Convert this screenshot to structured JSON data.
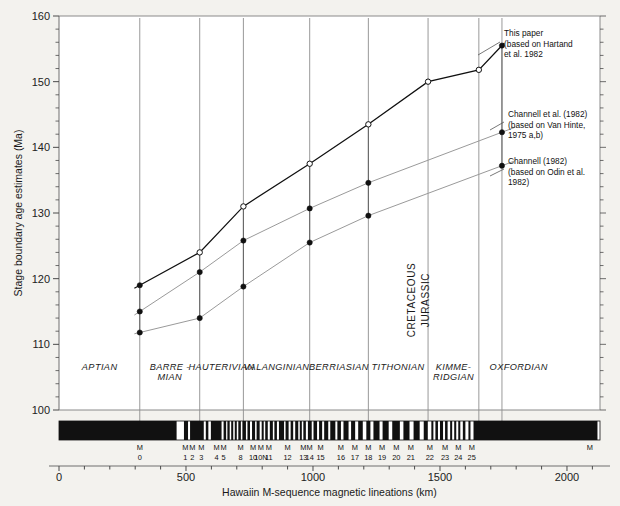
{
  "figure": {
    "background": "#f3f2ee",
    "plot_background": "#ffffff"
  },
  "chart_data": {
    "type": "line",
    "title": "",
    "xlabel": "Hawaiin M-sequence magnetic lineations (km)",
    "ylabel": "Stage boundary age estimates (Ma)",
    "xlim": [
      0,
      2130
    ],
    "ylim": [
      100,
      160
    ],
    "x_ticks": [
      0,
      500,
      1000,
      1500,
      2000
    ],
    "x_tick_labels": [
      "0",
      "500",
      "1000",
      "1500",
      "2000"
    ],
    "x_minor_step": 100,
    "y_ticks": [
      100,
      110,
      120,
      130,
      140,
      150,
      160
    ],
    "y_tick_labels": [
      "100",
      "110",
      "120",
      "130",
      "140",
      "150",
      "160"
    ],
    "y_minor_step": 2,
    "grid": false,
    "legend_position": "right-annotations",
    "boundary_x_km": [
      318,
      554,
      726,
      987,
      1218,
      1453,
      1653,
      1744
    ],
    "series": [
      {
        "name": "This paper (based on Harland et al. 1982)",
        "style": "dark",
        "marker": "mixed",
        "x": [
          318,
          554,
          726,
          987,
          1218,
          1453,
          1653,
          1744
        ],
        "y": [
          119.0,
          124.0,
          131.0,
          137.5,
          143.5,
          150.0,
          151.8,
          155.5
        ],
        "markers": [
          "filled",
          "open",
          "open",
          "open",
          "open",
          "open",
          "open",
          "filled"
        ]
      },
      {
        "name": "Channell et al. (1982) (based on Van Hinte, 1975 a,b)",
        "style": "grey",
        "marker": "filled",
        "x": [
          318,
          554,
          726,
          987,
          1218,
          1744
        ],
        "y": [
          115.0,
          121.0,
          125.8,
          130.7,
          134.6,
          142.3
        ]
      },
      {
        "name": "Channell (1982) (based on Odin et al. 1982)",
        "style": "grey",
        "marker": "filled",
        "x": [
          318,
          554,
          726,
          987,
          1218,
          1744
        ],
        "y": [
          111.8,
          114.0,
          118.8,
          125.5,
          129.6,
          137.2
        ]
      }
    ],
    "stages": [
      {
        "label": "APTIAN",
        "lines": [
          "APTIAN"
        ],
        "x_center": 160
      },
      {
        "label": "BARRE-MIAN",
        "lines": [
          "BARRE -",
          "MIAN"
        ],
        "x_center": 436
      },
      {
        "label": "HAUTERIVIAN",
        "lines": [
          "HAUTERIVIAN"
        ],
        "x_center": 640
      },
      {
        "label": "VALANGINIAN",
        "lines": [
          "VALANGINIAN"
        ],
        "x_center": 856
      },
      {
        "label": "BERRIASIAN",
        "lines": [
          "BERRIASIAN"
        ],
        "x_center": 1102
      },
      {
        "label": "TITHONIAN",
        "lines": [
          "TITHONIAN"
        ],
        "x_center": 1335
      },
      {
        "label": "KIMME-RIDGIAN",
        "lines": [
          "KIMME-",
          "RIDGIAN"
        ],
        "x_center": 1553
      },
      {
        "label": "OXFORDIAN",
        "lines": [
          "OXFORDIAN"
        ],
        "x_center": 1810
      }
    ],
    "periods": [
      {
        "label": "CRETACEOUS",
        "x": 1400
      },
      {
        "label": "JURASSIC",
        "x": 1455
      }
    ],
    "annotations": [
      {
        "id": "this-paper",
        "lines": [
          "This paper",
          "(based on Hartand",
          "et al. 1982"
        ],
        "target_x": 1744,
        "target_y": 155.5
      },
      {
        "id": "channell-et-al",
        "lines": [
          "Channell et al. (1982)",
          "(based on Van Hinte,",
          "1975 a,b)"
        ],
        "target_x": 1744,
        "target_y": 142.3
      },
      {
        "id": "channell",
        "lines": [
          "Channell (1982)",
          "(based on Odin et al.",
          "1982)"
        ],
        "target_x": 1744,
        "target_y": 137.2
      }
    ],
    "magnetic_labels": [
      {
        "name": "M",
        "num": "0",
        "x_km": 318
      },
      {
        "name": "M",
        "num": "1",
        "x_km": 497
      },
      {
        "name": "M",
        "num": "2",
        "x_km": 525
      },
      {
        "name": "M",
        "num": "3",
        "x_km": 560
      },
      {
        "name": "M",
        "num": "4",
        "x_km": 620
      },
      {
        "name": "M",
        "num": "5",
        "x_km": 648
      },
      {
        "name": "M",
        "num": "8",
        "x_km": 715
      },
      {
        "name": "M",
        "num": "10",
        "x_km": 764
      },
      {
        "name": "M",
        "num": "10N",
        "x_km": 795
      },
      {
        "name": "M",
        "num": "11",
        "x_km": 826
      },
      {
        "name": "M",
        "num": "12",
        "x_km": 900
      },
      {
        "name": "M",
        "num": "13",
        "x_km": 962
      },
      {
        "name": "M",
        "num": "14",
        "x_km": 987
      },
      {
        "name": "M",
        "num": "15",
        "x_km": 1030
      },
      {
        "name": "M",
        "num": "16",
        "x_km": 1110
      },
      {
        "name": "M",
        "num": "17",
        "x_km": 1165
      },
      {
        "name": "M",
        "num": "18",
        "x_km": 1218
      },
      {
        "name": "M",
        "num": "19",
        "x_km": 1272
      },
      {
        "name": "M",
        "num": "20",
        "x_km": 1328
      },
      {
        "name": "M",
        "num": "21",
        "x_km": 1385
      },
      {
        "name": "M",
        "num": "22",
        "x_km": 1460
      },
      {
        "name": "M",
        "num": "23",
        "x_km": 1520
      },
      {
        "name": "M",
        "num": "24",
        "x_km": 1572
      },
      {
        "name": "M",
        "num": "25",
        "x_km": 1625
      },
      {
        "name": "M",
        "num": "",
        "x_km": 2090
      }
    ],
    "magnetic_bar": {
      "description": "Hawaiian M-sequence magnetic polarity block model (black = normal polarity)",
      "black_intervals_km": [
        [
          0,
          463
        ],
        [
          492,
          508
        ],
        [
          516,
          570
        ],
        [
          578,
          588
        ],
        [
          598,
          640
        ],
        [
          648,
          658
        ],
        [
          663,
          672
        ],
        [
          678,
          686
        ],
        [
          692,
          700
        ],
        [
          706,
          716
        ],
        [
          722,
          736
        ],
        [
          742,
          752
        ],
        [
          760,
          772
        ],
        [
          778,
          790
        ],
        [
          798,
          806
        ],
        [
          812,
          822
        ],
        [
          830,
          842
        ],
        [
          848,
          858
        ],
        [
          866,
          886
        ],
        [
          892,
          904
        ],
        [
          912,
          922
        ],
        [
          930,
          942
        ],
        [
          948,
          956
        ],
        [
          962,
          972
        ],
        [
          980,
          995
        ],
        [
          1002,
          1016
        ],
        [
          1024,
          1036
        ],
        [
          1044,
          1060
        ],
        [
          1068,
          1088
        ],
        [
          1096,
          1110
        ],
        [
          1120,
          1140
        ],
        [
          1150,
          1166
        ],
        [
          1178,
          1196
        ],
        [
          1210,
          1226
        ],
        [
          1238,
          1262
        ],
        [
          1274,
          1298
        ],
        [
          1312,
          1342
        ],
        [
          1356,
          1380
        ],
        [
          1396,
          1420
        ],
        [
          1436,
          1452
        ],
        [
          1466,
          1474
        ],
        [
          1482,
          1492
        ],
        [
          1500,
          1512
        ],
        [
          1520,
          1530
        ],
        [
          1540,
          1548
        ],
        [
          1556,
          1564
        ],
        [
          1572,
          1580
        ],
        [
          1590,
          1600
        ],
        [
          1612,
          1620
        ],
        [
          1632,
          2120
        ]
      ]
    }
  }
}
